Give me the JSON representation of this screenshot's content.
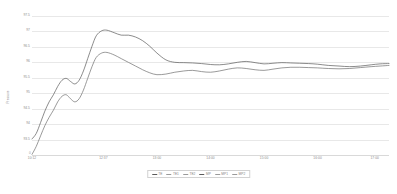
{
  "chart_data": {
    "type": "line",
    "title": "",
    "xlabel": "",
    "ylabel": "Pressure",
    "ylim": [
      93.0,
      97.5
    ],
    "yticks": [
      97.5,
      97.0,
      96.5,
      96.0,
      95.5,
      95.0,
      94.5,
      94.0,
      93.5
    ],
    "ytick_labels": [
      "97.5",
      "97",
      "96.5",
      "96",
      "95.5",
      "95",
      "94.5",
      "94",
      "93.5"
    ],
    "grid": true,
    "grid_axis": "y",
    "legend_position": "bottom-center",
    "x_origin_label": "0",
    "xticks": [
      "10:12",
      "12:37",
      "13:00",
      "14:00",
      "15:00",
      "16:00",
      "17:00"
    ],
    "xtick_positions": [
      0.0,
      0.2,
      0.35,
      0.5,
      0.65,
      0.8,
      0.96
    ],
    "series": [
      {
        "name": "TE",
        "color": "#5a5a5a",
        "x": [
          0.0,
          0.012,
          0.024,
          0.036,
          0.048,
          0.06,
          0.072,
          0.084,
          0.096,
          0.108,
          0.12,
          0.132,
          0.144,
          0.156,
          0.168,
          0.18,
          0.195,
          0.21,
          0.23,
          0.25,
          0.27,
          0.29,
          0.31,
          0.33,
          0.35,
          0.375,
          0.4,
          0.425,
          0.45,
          0.475,
          0.5,
          0.525,
          0.55,
          0.575,
          0.6,
          0.625,
          0.65,
          0.675,
          0.7,
          0.725,
          0.75,
          0.775,
          0.8,
          0.83,
          0.86,
          0.89,
          0.92,
          0.95,
          0.975,
          1.0
        ],
        "values": [
          93.52,
          93.7,
          94.05,
          94.42,
          94.72,
          94.95,
          95.22,
          95.42,
          95.48,
          95.38,
          95.3,
          95.42,
          95.72,
          96.12,
          96.52,
          96.86,
          97.02,
          97.04,
          96.96,
          96.88,
          96.88,
          96.82,
          96.7,
          96.52,
          96.3,
          96.08,
          96.0,
          95.99,
          95.98,
          95.96,
          95.93,
          95.92,
          95.95,
          96.0,
          96.03,
          95.99,
          95.95,
          95.97,
          95.99,
          95.98,
          95.97,
          95.96,
          95.94,
          95.9,
          95.88,
          95.86,
          95.88,
          95.92,
          95.95,
          95.96
        ]
      },
      {
        "name": "MP",
        "color": "#6e6e6e",
        "x": [
          0.0,
          0.012,
          0.024,
          0.036,
          0.048,
          0.06,
          0.072,
          0.084,
          0.096,
          0.108,
          0.12,
          0.132,
          0.144,
          0.156,
          0.168,
          0.18,
          0.195,
          0.21,
          0.23,
          0.25,
          0.27,
          0.29,
          0.31,
          0.33,
          0.35,
          0.375,
          0.4,
          0.425,
          0.45,
          0.475,
          0.5,
          0.525,
          0.55,
          0.575,
          0.6,
          0.625,
          0.65,
          0.675,
          0.7,
          0.725,
          0.75,
          0.775,
          0.8,
          0.83,
          0.86,
          0.89,
          0.92,
          0.95,
          0.975,
          1.0
        ],
        "values": [
          93.02,
          93.28,
          93.62,
          93.95,
          94.22,
          94.45,
          94.72,
          94.9,
          94.95,
          94.82,
          94.72,
          94.82,
          95.1,
          95.48,
          95.86,
          96.16,
          96.3,
          96.32,
          96.24,
          96.12,
          96.0,
          95.88,
          95.76,
          95.66,
          95.6,
          95.62,
          95.68,
          95.72,
          95.74,
          95.7,
          95.68,
          95.72,
          95.78,
          95.82,
          95.8,
          95.76,
          95.74,
          95.78,
          95.82,
          95.84,
          95.84,
          95.83,
          95.82,
          95.8,
          95.79,
          95.8,
          95.83,
          95.86,
          95.88,
          95.9
        ]
      }
    ],
    "legend_entries": [
      {
        "label": "TE",
        "color": "#5a5a5a",
        "style": "solid"
      },
      {
        "label": "TE1",
        "color": "#9a9a9a",
        "style": "dashed"
      },
      {
        "label": "TE2",
        "color": "#9a9a9a",
        "style": "dashed"
      },
      {
        "label": "MP",
        "color": "#5a5a5a",
        "style": "solid"
      },
      {
        "label": "MP1",
        "color": "#9a9a9a",
        "style": "dashed"
      },
      {
        "label": "MP2",
        "color": "#9a9a9a",
        "style": "dashed"
      }
    ]
  }
}
